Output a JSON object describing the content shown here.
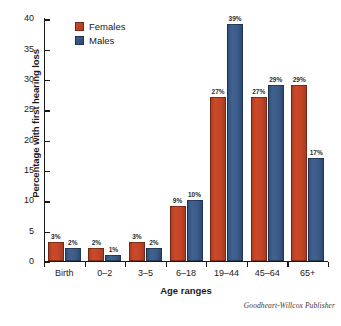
{
  "chart_data": {
    "type": "bar",
    "title": "",
    "xlabel": "Age ranges",
    "ylabel": "Percentage with first hearing loss",
    "categories": [
      "Birth",
      "0–2",
      "3–5",
      "6–18",
      "19–44",
      "45–64",
      "65+"
    ],
    "series": [
      {
        "name": "Females",
        "color": "#c24428",
        "values": [
          3,
          2,
          3,
          9,
          27,
          27,
          29
        ],
        "labels": [
          "3%",
          "2%",
          "3%",
          "9%",
          "27%",
          "27%",
          "29%"
        ]
      },
      {
        "name": "Males",
        "color": "#3b5a88",
        "values": [
          2,
          1,
          2,
          10,
          39,
          29,
          17
        ],
        "labels": [
          "2%",
          "1%",
          "2%",
          "10%",
          "39%",
          "29%",
          "17%"
        ]
      }
    ],
    "ylim": [
      0,
      40
    ],
    "yticks": [
      0,
      5,
      10,
      15,
      20,
      25,
      30,
      35,
      40
    ],
    "ytick_labels": [
      "0",
      "5",
      "10",
      "15",
      "20",
      "25",
      "30",
      "35",
      "40"
    ],
    "grid": false,
    "legend_position": "top-left",
    "value_labels_shown": true
  },
  "legend": {
    "items": [
      {
        "label": "Females",
        "color": "#c24428"
      },
      {
        "label": "Males",
        "color": "#3b5a88"
      }
    ]
  },
  "credit": {
    "text": "Goodheart-Willcox Publisher"
  }
}
